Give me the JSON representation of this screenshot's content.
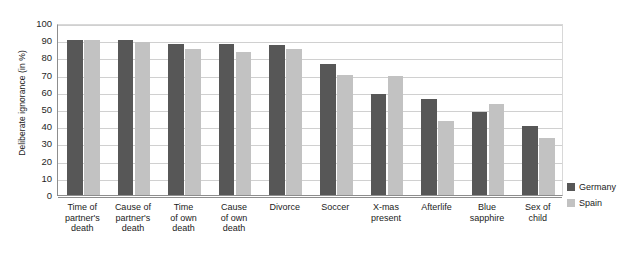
{
  "chart_data": {
    "type": "bar",
    "title": "",
    "subtitle": "",
    "xlabel": "",
    "ylabel": "Deliberate ignorance (in %)",
    "ylim": [
      0,
      100
    ],
    "ytick_step": 10,
    "yticks": [
      "100",
      "90",
      "80",
      "70",
      "60",
      "50",
      "40",
      "30",
      "20",
      "10",
      "0"
    ],
    "grid": true,
    "legend_position": "right",
    "categories": [
      "Time of\npartner's\ndeath",
      "Cause of\npartner's\ndeath",
      "Time\nof own\ndeath",
      "Cause\nof own\ndeath",
      "Divorce",
      "Soccer",
      "X-mas\npresent",
      "Afterlife",
      "Blue\nsapphire",
      "Sex of\nchild"
    ],
    "series": [
      {
        "name": "Germany",
        "color": "#575757",
        "values": [
          90,
          90,
          88,
          88,
          87,
          76,
          59,
          56,
          48,
          40
        ]
      },
      {
        "name": "Spain",
        "color": "#c2c2c2",
        "values": [
          90,
          89,
          85,
          83,
          85,
          70,
          69,
          43,
          53,
          33
        ]
      }
    ]
  },
  "legend": {
    "items": [
      {
        "label": "Germany",
        "color": "#575757"
      },
      {
        "label": "Spain",
        "color": "#c2c2c2"
      }
    ]
  },
  "colors": {
    "germany": "#575757",
    "spain": "#c2c2c2",
    "grid": "#d0d0d0",
    "axis": "#8d8d8d",
    "background": "#ffffff"
  }
}
